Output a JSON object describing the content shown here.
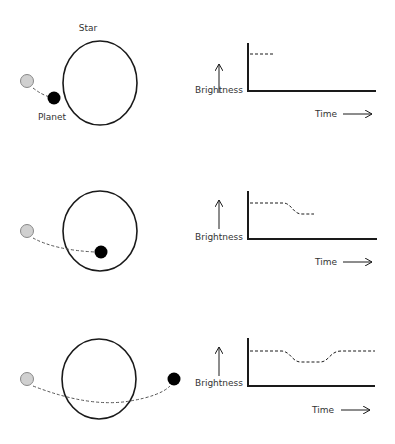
{
  "labels": {
    "star": "Star",
    "planet": "Planet",
    "brightness": "Brightness",
    "time": "Time"
  },
  "colors": {
    "stroke": "#1a1a1a",
    "planet_fill": "#000000",
    "ghost_planet_fill": "#d0d0d0",
    "ghost_planet_stroke": "#888888",
    "path": "#555555"
  },
  "panels": [
    {
      "stage": "before transit",
      "brightness_curve": "flat high, short segment"
    },
    {
      "stage": "entering transit",
      "brightness_curve": "high then dips"
    },
    {
      "stage": "after transit",
      "brightness_curve": "high, dip, then recovers to high"
    }
  ]
}
